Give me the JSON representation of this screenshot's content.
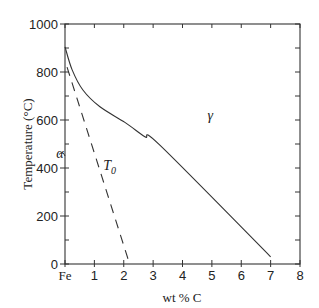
{
  "chart_data": {
    "type": "line",
    "title": "",
    "xlabel": "wt % C",
    "ylabel": "Temperature (°C)",
    "xlim": [
      0,
      8
    ],
    "ylim": [
      0,
      1000
    ],
    "x_ticks": [
      0,
      1,
      2,
      3,
      4,
      5,
      6,
      7,
      8
    ],
    "x_tick_labels": [
      "Fe",
      "1",
      "2",
      "3",
      "4",
      "5",
      "6",
      "7",
      "8"
    ],
    "y_ticks": [
      0,
      200,
      400,
      600,
      800,
      1000
    ],
    "y_tick_labels": [
      "0",
      "200",
      "400",
      "600",
      "800",
      "1000"
    ],
    "grid": false,
    "series": [
      {
        "name": "gamma phase boundary",
        "style": "solid",
        "x": [
          0,
          0.24,
          0.61,
          1.19,
          2.04,
          2.72,
          3.23,
          7.0
        ],
        "y": [
          905,
          810,
          725,
          655,
          590,
          530,
          495,
          30
        ]
      },
      {
        "name": "T0",
        "style": "dashed",
        "x": [
          0.07,
          2.2
        ],
        "y": [
          820,
          0
        ]
      }
    ],
    "annotations": [
      {
        "text": "γ",
        "x": 4.85,
        "y": 600
      },
      {
        "text": "T",
        "subscript": "0",
        "x": 1.3,
        "y": 390
      },
      {
        "text": "α",
        "x": -0.3,
        "y": 440
      }
    ]
  }
}
